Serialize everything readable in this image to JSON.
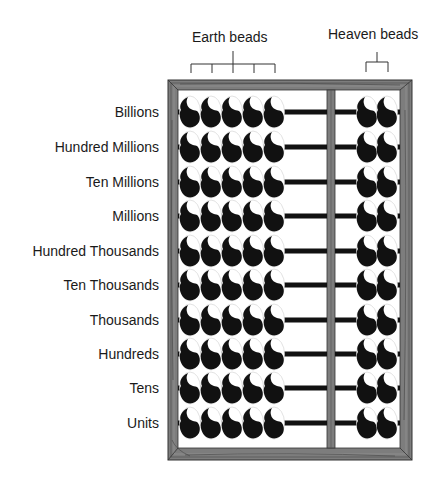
{
  "header": {
    "earth_label": "Earth beads",
    "heaven_label": "Heaven beads"
  },
  "rows": [
    {
      "label": "Billions"
    },
    {
      "label": "Hundred Millions"
    },
    {
      "label": "Ten Millions"
    },
    {
      "label": "Millions"
    },
    {
      "label": "Hundred Thousands"
    },
    {
      "label": "Ten Thousands"
    },
    {
      "label": "Thousands"
    },
    {
      "label": "Hundreds"
    },
    {
      "label": "Tens"
    },
    {
      "label": "Units"
    }
  ],
  "abacus": {
    "earth_beads_per_rod": 5,
    "heaven_beads_per_rod": 2,
    "rod_count": 10,
    "frame_color": "#7a7a7a",
    "bead_color": "#111111",
    "rod_color": "#111111"
  }
}
